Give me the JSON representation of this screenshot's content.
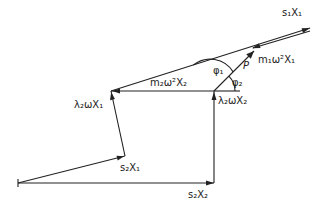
{
  "diagram": {
    "type": "vector-force-polygon",
    "labels": {
      "s1x1": "s₁X₁",
      "m1w2x1": "m₁ω²X₁",
      "p": "P",
      "phi1": "φ₁",
      "phi2": "φ₂",
      "m2w2x2": "m₂ω²X₂",
      "l2wx2": "λ₂ωX₂",
      "l2wx1": "λ₂ωX₁",
      "s2x1": "s₂X₁",
      "s2x2": "s₂X₂"
    },
    "vectors": [
      {
        "name": "s2X2",
        "from": [
          18,
          183
        ],
        "to": [
          214,
          183
        ]
      },
      {
        "name": "lambda2 omega X2",
        "from": [
          214,
          183
        ],
        "to": [
          214,
          91
        ]
      },
      {
        "name": "m2 omega^2 X2",
        "from": [
          214,
          91
        ],
        "to": [
          111,
          91
        ]
      },
      {
        "name": "s2X1",
        "from": [
          18,
          183
        ],
        "to": [
          125,
          156
        ]
      },
      {
        "name": "lambda2 omega X1",
        "from": [
          125,
          156
        ],
        "to": [
          111,
          91
        ]
      },
      {
        "name": "s1X1",
        "from": [
          111,
          91
        ],
        "to": [
          310,
          28
        ]
      },
      {
        "name": "m1 omega^2 X1",
        "from": [
          310,
          31
        ],
        "to": [
          253,
          47
        ]
      },
      {
        "name": "P",
        "from": [
          214,
          91
        ],
        "to": [
          254,
          51
        ]
      }
    ]
  }
}
